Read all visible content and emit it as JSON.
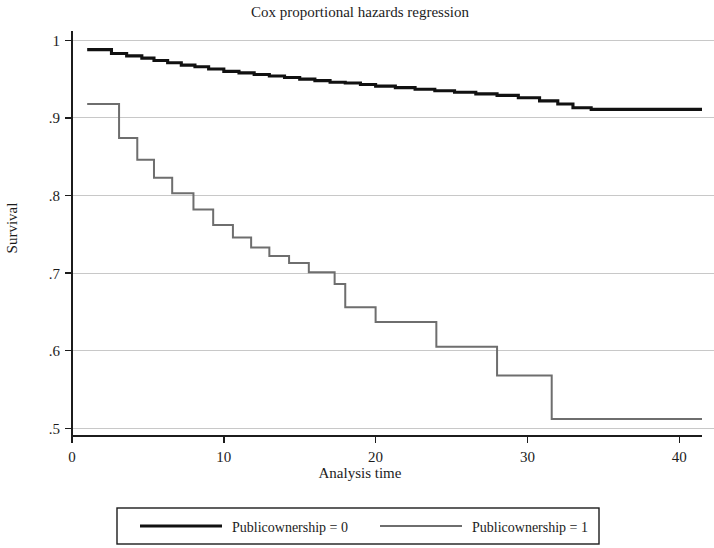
{
  "chart_data": {
    "type": "line",
    "subtype": "step-survival",
    "title": "Cox proportional hazards regression",
    "xlabel": "Analysis time",
    "ylabel": "Survival",
    "xlim": [
      0,
      41.5
    ],
    "ylim": [
      0.49,
      1.012
    ],
    "xticks": [
      0,
      10,
      20,
      30,
      40
    ],
    "xtick_labels": [
      "0",
      "10",
      "20",
      "30",
      "40"
    ],
    "yticks": [
      0.5,
      0.6,
      0.7,
      0.8,
      0.9,
      1.0
    ],
    "ytick_labels": [
      ".5",
      ".6",
      ".7",
      ".8",
      ".9",
      "1"
    ],
    "grid": "horizontal",
    "legend_position": "below",
    "series": [
      {
        "name": "Publicownership = 0",
        "color": "#111111",
        "width": 3.1,
        "x": [
          1.0,
          1.6,
          2.6,
          3.6,
          4.6,
          5.4,
          6.3,
          7.2,
          8.1,
          9.0,
          10.0,
          11.0,
          12.0,
          13.0,
          14.0,
          15.0,
          16.0,
          17.0,
          18.0,
          19.0,
          20.0,
          21.3,
          22.6,
          23.9,
          25.2,
          26.6,
          28.0,
          29.4,
          30.8,
          32.0,
          33.0,
          34.2,
          41.5
        ],
        "y": [
          0.988,
          0.988,
          0.983,
          0.98,
          0.977,
          0.974,
          0.971,
          0.968,
          0.966,
          0.963,
          0.96,
          0.958,
          0.956,
          0.954,
          0.952,
          0.95,
          0.948,
          0.946,
          0.945,
          0.943,
          0.941,
          0.939,
          0.937,
          0.935,
          0.933,
          0.931,
          0.929,
          0.926,
          0.922,
          0.918,
          0.913,
          0.911,
          0.911
        ]
      },
      {
        "name": "Publicownership = 1",
        "color": "#6e6e6e",
        "width": 2.0,
        "x": [
          1.0,
          1.8,
          3.1,
          4.3,
          5.4,
          6.6,
          8.0,
          9.3,
          10.6,
          11.8,
          13.0,
          14.3,
          15.6,
          16.0,
          17.3,
          18.0,
          20.0,
          22.0,
          24.0,
          24.2,
          28.0,
          28.2,
          31.6,
          33.0,
          41.5
        ],
        "y": [
          0.918,
          0.918,
          0.874,
          0.846,
          0.823,
          0.803,
          0.782,
          0.762,
          0.746,
          0.733,
          0.722,
          0.713,
          0.701,
          0.701,
          0.686,
          0.656,
          0.637,
          0.637,
          0.605,
          0.605,
          0.568,
          0.568,
          0.512,
          0.512,
          0.512
        ]
      }
    ]
  },
  "legend": {
    "entries": [
      {
        "label": "Publicownership = 0",
        "color": "#111111",
        "width": 3.1
      },
      {
        "label": "Publicownership = 1",
        "color": "#6e6e6e",
        "width": 2.0
      }
    ]
  }
}
